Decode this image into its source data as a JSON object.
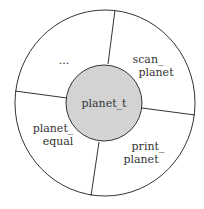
{
  "diagram": {
    "center_label": "planet_t",
    "segments": [
      {
        "id": "ellipsis",
        "lines": [
          "..."
        ]
      },
      {
        "id": "scan-planet",
        "lines": [
          "scan_",
          "planet"
        ]
      },
      {
        "id": "print-planet",
        "lines": [
          "print_",
          "planet"
        ]
      },
      {
        "id": "planet-equal",
        "lines": [
          "planet_",
          "equal"
        ]
      }
    ],
    "colors": {
      "stroke": "#333333",
      "inner_fill": "#d3d3d3",
      "background": "#ffffff"
    }
  }
}
